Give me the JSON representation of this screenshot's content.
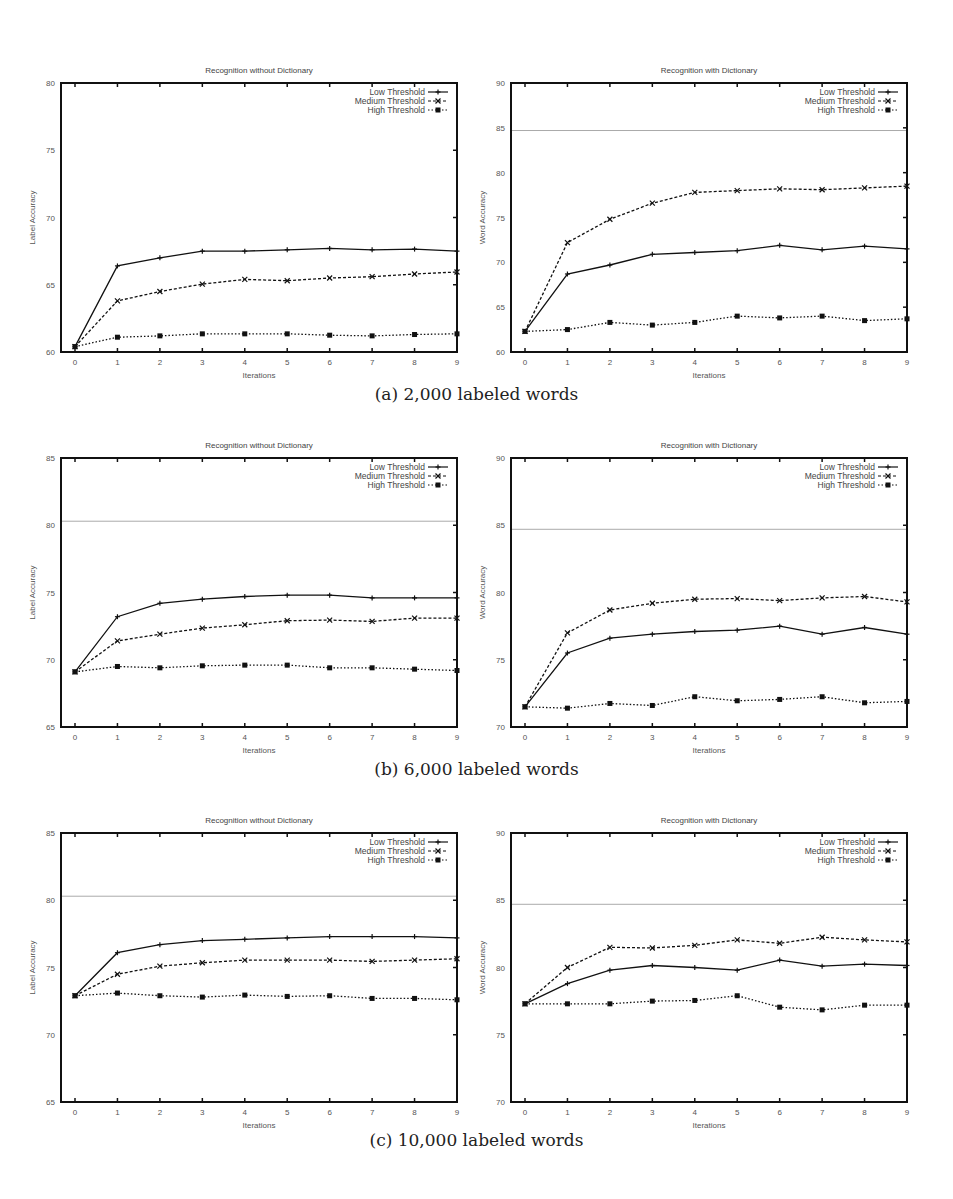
{
  "figure": {
    "captions": [
      "(a) 2,000 labeled words",
      "(b) 6,000 labeled words",
      "(c) 10,000 labeled words"
    ]
  },
  "chart_data": [
    {
      "id": "a-left",
      "type": "line",
      "title": "Recognition without Dictionary",
      "xlabel": "Iterations",
      "ylabel": "Label Accuracy",
      "x": [
        0,
        1,
        2,
        3,
        4,
        5,
        6,
        7,
        8,
        9
      ],
      "ylim": [
        60,
        80
      ],
      "yticks": [
        60,
        65,
        70,
        75,
        80
      ],
      "reference_line": null,
      "legend_position": "top-right",
      "grid": false,
      "series": [
        {
          "name": "Low Threshold",
          "style": "solid-plus",
          "values": [
            60.4,
            66.4,
            67.0,
            67.5,
            67.5,
            67.6,
            67.7,
            67.6,
            67.65,
            67.5
          ]
        },
        {
          "name": "Medium Threshold",
          "style": "dashed-x",
          "values": [
            60.4,
            63.8,
            64.5,
            65.05,
            65.4,
            65.3,
            65.5,
            65.6,
            65.8,
            65.95
          ]
        },
        {
          "name": "High Threshold",
          "style": "dotted-square",
          "values": [
            60.4,
            61.1,
            61.2,
            61.35,
            61.35,
            61.35,
            61.25,
            61.2,
            61.3,
            61.35
          ]
        }
      ]
    },
    {
      "id": "a-right",
      "type": "line",
      "title": "Recognition with Dictionary",
      "xlabel": "Iterations",
      "ylabel": "Word Accuracy",
      "x": [
        0,
        1,
        2,
        3,
        4,
        5,
        6,
        7,
        8,
        9
      ],
      "ylim": [
        60,
        90
      ],
      "yticks": [
        60,
        65,
        70,
        75,
        80,
        85,
        90
      ],
      "reference_line": 84.7,
      "legend_position": "top-right",
      "grid": false,
      "series": [
        {
          "name": "Low Threshold",
          "style": "solid-plus",
          "values": [
            62.3,
            68.7,
            69.7,
            70.9,
            71.1,
            71.3,
            71.9,
            71.4,
            71.8,
            71.5
          ]
        },
        {
          "name": "Medium Threshold",
          "style": "dashed-x",
          "values": [
            62.3,
            72.2,
            74.8,
            76.6,
            77.8,
            78.0,
            78.2,
            78.1,
            78.3,
            78.5
          ]
        },
        {
          "name": "High Threshold",
          "style": "dotted-square",
          "values": [
            62.3,
            62.5,
            63.3,
            63.0,
            63.3,
            64.0,
            63.8,
            64.0,
            63.5,
            63.7
          ]
        }
      ]
    },
    {
      "id": "b-left",
      "type": "line",
      "title": "Recognition without Dictionary",
      "xlabel": "Iterations",
      "ylabel": "Label Accuracy",
      "x": [
        0,
        1,
        2,
        3,
        4,
        5,
        6,
        7,
        8,
        9
      ],
      "ylim": [
        65,
        85
      ],
      "yticks": [
        65,
        70,
        75,
        80,
        85
      ],
      "reference_line": 80.3,
      "legend_position": "top-right",
      "grid": false,
      "series": [
        {
          "name": "Low Threshold",
          "style": "solid-plus",
          "values": [
            69.1,
            73.2,
            74.2,
            74.5,
            74.7,
            74.8,
            74.8,
            74.6,
            74.6,
            74.6
          ]
        },
        {
          "name": "Medium Threshold",
          "style": "dashed-x",
          "values": [
            69.1,
            71.4,
            71.9,
            72.35,
            72.6,
            72.9,
            72.95,
            72.85,
            73.1,
            73.1
          ]
        },
        {
          "name": "High Threshold",
          "style": "dotted-square",
          "values": [
            69.1,
            69.5,
            69.4,
            69.55,
            69.6,
            69.6,
            69.4,
            69.4,
            69.3,
            69.2
          ]
        }
      ]
    },
    {
      "id": "b-right",
      "type": "line",
      "title": "Recognition with Dictionary",
      "xlabel": "Iterations",
      "ylabel": "Word Accuracy",
      "x": [
        0,
        1,
        2,
        3,
        4,
        5,
        6,
        7,
        8,
        9
      ],
      "ylim": [
        70,
        90
      ],
      "yticks": [
        70,
        75,
        80,
        85,
        90
      ],
      "reference_line": 84.7,
      "legend_position": "top-right",
      "grid": false,
      "series": [
        {
          "name": "Low Threshold",
          "style": "solid-plus",
          "values": [
            71.5,
            75.5,
            76.6,
            76.9,
            77.1,
            77.2,
            77.5,
            76.9,
            77.4,
            76.9
          ]
        },
        {
          "name": "Medium Threshold",
          "style": "dashed-x",
          "values": [
            71.5,
            77.0,
            78.7,
            79.2,
            79.5,
            79.55,
            79.4,
            79.6,
            79.7,
            79.3
          ]
        },
        {
          "name": "High Threshold",
          "style": "dotted-square",
          "values": [
            71.5,
            71.4,
            71.75,
            71.6,
            72.25,
            71.95,
            72.05,
            72.25,
            71.8,
            71.9
          ]
        }
      ]
    },
    {
      "id": "c-left",
      "type": "line",
      "title": "Recognition without Dictionary",
      "xlabel": "Iterations",
      "ylabel": "Label Accuracy",
      "x": [
        0,
        1,
        2,
        3,
        4,
        5,
        6,
        7,
        8,
        9
      ],
      "ylim": [
        65,
        85
      ],
      "yticks": [
        65,
        70,
        75,
        80,
        85
      ],
      "reference_line": 80.3,
      "legend_position": "top-right",
      "grid": false,
      "series": [
        {
          "name": "Low Threshold",
          "style": "solid-plus",
          "values": [
            72.9,
            76.1,
            76.7,
            77.0,
            77.1,
            77.2,
            77.3,
            77.3,
            77.3,
            77.2
          ]
        },
        {
          "name": "Medium Threshold",
          "style": "dashed-x",
          "values": [
            72.9,
            74.5,
            75.1,
            75.35,
            75.55,
            75.55,
            75.55,
            75.45,
            75.55,
            75.65
          ]
        },
        {
          "name": "High Threshold",
          "style": "dotted-square",
          "values": [
            72.9,
            73.1,
            72.9,
            72.8,
            72.95,
            72.85,
            72.9,
            72.7,
            72.7,
            72.6
          ]
        }
      ]
    },
    {
      "id": "c-right",
      "type": "line",
      "title": "Recognition with Dictionary",
      "xlabel": "Iterations",
      "ylabel": "Word Accuracy",
      "x": [
        0,
        1,
        2,
        3,
        4,
        5,
        6,
        7,
        8,
        9
      ],
      "ylim": [
        70,
        90
      ],
      "yticks": [
        70,
        75,
        80,
        85,
        90
      ],
      "reference_line": 84.7,
      "legend_position": "top-right",
      "grid": false,
      "series": [
        {
          "name": "Low Threshold",
          "style": "solid-plus",
          "values": [
            77.3,
            78.8,
            79.8,
            80.15,
            80.0,
            79.8,
            80.55,
            80.1,
            80.25,
            80.15
          ]
        },
        {
          "name": "Medium Threshold",
          "style": "dashed-x",
          "values": [
            77.3,
            80.0,
            81.5,
            81.45,
            81.65,
            82.05,
            81.8,
            82.25,
            82.05,
            81.9
          ]
        },
        {
          "name": "High Threshold",
          "style": "dotted-square",
          "values": [
            77.3,
            77.3,
            77.3,
            77.5,
            77.55,
            77.9,
            77.05,
            76.85,
            77.2,
            77.2
          ]
        }
      ]
    }
  ]
}
